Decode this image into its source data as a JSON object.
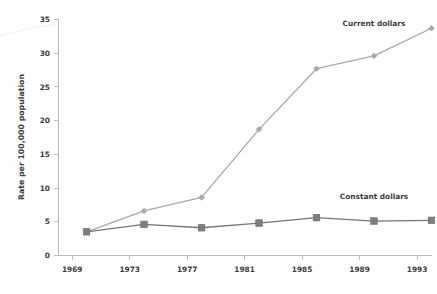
{
  "chart_data": {
    "type": "line",
    "title": "",
    "xlabel": "",
    "ylabel": "Rate per 100,000 population",
    "xlim": [
      1969,
      1995
    ],
    "ylim": [
      0,
      35
    ],
    "grid": false,
    "legend_position": "inline-right",
    "x": [
      1970,
      1974,
      1978,
      1982,
      1986,
      1990,
      1994
    ],
    "xticks": [
      1969,
      1973,
      1977,
      1981,
      1985,
      1989,
      1993
    ],
    "xtick_labels": [
      "1969",
      "1973",
      "1977",
      "1981",
      "1985",
      "1989",
      "1993"
    ],
    "yticks": [
      0,
      5,
      10,
      15,
      20,
      25,
      30,
      35
    ],
    "ytick_labels": [
      "0",
      "5",
      "10",
      "15",
      "20",
      "25",
      "30",
      "35"
    ],
    "series": [
      {
        "name": "Current dollars",
        "label": "Current dollars",
        "color": "#a8a8a8",
        "marker": "diamond",
        "values": [
          3.5,
          6.6,
          8.6,
          18.7,
          27.7,
          29.6,
          33.7
        ]
      },
      {
        "name": "Constant dollars",
        "label": "Constant dollars",
        "color": "#7d7d7d",
        "marker": "square",
        "values": [
          3.5,
          4.6,
          4.1,
          4.8,
          5.6,
          5.1,
          5.2
        ]
      }
    ],
    "annotations": [
      {
        "text": "Current dollars",
        "x": 1990.0,
        "y": 34.0
      },
      {
        "text": "Constant dollars",
        "x": 1990.0,
        "y": 8.4
      }
    ]
  },
  "axes": {
    "y_axis_title": "Rate per 100,000 population"
  }
}
